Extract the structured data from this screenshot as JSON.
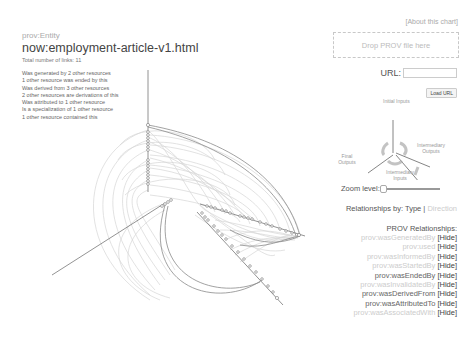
{
  "entity": {
    "type": "prov:Entity",
    "title": "now:employment-article-v1.html",
    "total_links": "Total number of links: 11",
    "relations": [
      "Was generated by 2 other resources",
      "1 other resource was ended by this",
      "Was derived from 3 other resources",
      "2 other resources are derivations of this",
      "Was attributed to 1 other resource",
      "Is a specialization of 1 other resource",
      "1 other resource contained this"
    ]
  },
  "controls": {
    "about_link": "[About this chart]",
    "drop_zone": "Drop PROV file here",
    "url_label": "URL:",
    "url_value": "",
    "load_button": "Load URL",
    "zoom_label": "Zoom level:",
    "relationships_by_label": "Relationships by:",
    "relationships_by_type": "Type",
    "relationships_by_separator": "|",
    "relationships_by_direction": "Direction"
  },
  "diagram": {
    "labels": {
      "initial_inputs": "Initial Inputs",
      "intermediary_outputs": "Intermediary Outputs",
      "final_outputs": "Final Outputs",
      "intermediary_inputs": "Intermediary Inputs"
    }
  },
  "prov_relationships": {
    "heading": "PROV Relationships:",
    "hide_label": "[Hide]",
    "items": [
      {
        "name": "prov:wasGeneratedBy",
        "style": "faint"
      },
      {
        "name": "prov:used",
        "style": "faint"
      },
      {
        "name": "prov:wasInformedBy",
        "style": "faint"
      },
      {
        "name": "prov:wasStartedBy",
        "style": "faint"
      },
      {
        "name": "prov:wasEndedBy",
        "style": "dark"
      },
      {
        "name": "prov:wasInvalidatedBy",
        "style": "faint"
      },
      {
        "name": "prov:wasDerivedFrom",
        "style": "dark"
      },
      {
        "name": "prov:wasAttributedTo",
        "style": "dark"
      },
      {
        "name": "prov:wasAssociatedWith",
        "style": "faint"
      }
    ]
  },
  "colors": {
    "node_stroke": "#777777",
    "edge_light": "#cfcfcf",
    "edge_dark": "#8a8a8a",
    "faint_text": "#cccccc",
    "dark_text": "#555555"
  }
}
